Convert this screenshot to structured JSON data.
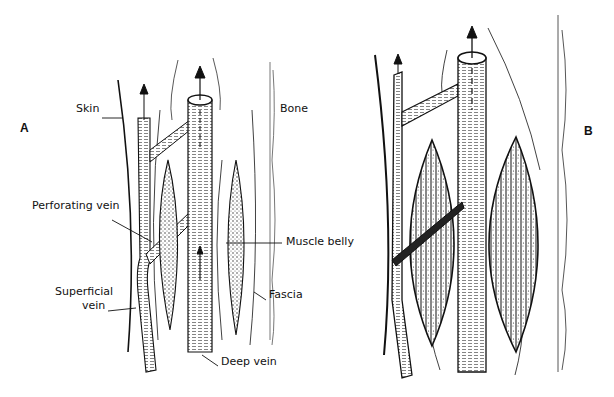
{
  "figure": {
    "panels": [
      {
        "id": "A",
        "label": "A"
      },
      {
        "id": "B",
        "label": "B"
      }
    ],
    "labels": {
      "skin": "Skin",
      "bone": "Bone",
      "perforating_vein": "Perforating vein",
      "muscle_belly": "Muscle belly",
      "superficial_vein_line1": "Superficial",
      "superficial_vein_line2": "vein",
      "fascia": "Fascia",
      "deep_vein": "Deep vein"
    },
    "colors": {
      "ink": "#111111",
      "background": "#ffffff",
      "stipple": "#555555"
    }
  }
}
